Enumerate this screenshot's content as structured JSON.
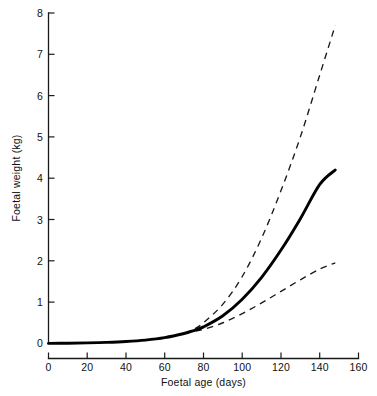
{
  "chart_data": {
    "type": "line",
    "title": "",
    "xlabel": "Foetal age (days)",
    "ylabel": "Foetal weight (kg)",
    "xlim": [
      0,
      160
    ],
    "ylim": [
      0,
      8
    ],
    "xticks": [
      0,
      20,
      40,
      60,
      80,
      100,
      120,
      140,
      160
    ],
    "xticklabels": [
      "0",
      "20",
      "40",
      "60",
      "80",
      "100",
      "120",
      "140",
      "160"
    ],
    "yticks": [
      0,
      1,
      2,
      3,
      4,
      5,
      6,
      7,
      8
    ],
    "yticklabels": [
      "0",
      "1",
      "2",
      "3",
      "4",
      "5",
      "6",
      "7",
      "8"
    ],
    "grid": false,
    "legend": "none",
    "series": [
      {
        "name": "mean-foetal-weight",
        "style": "solid",
        "linewidth": "thick",
        "color": "#000000",
        "x": [
          0,
          10,
          20,
          30,
          40,
          50,
          60,
          70,
          75,
          80,
          90,
          100,
          110,
          120,
          130,
          140,
          148
        ],
        "y": [
          0.0,
          0.005,
          0.012,
          0.024,
          0.045,
          0.08,
          0.14,
          0.24,
          0.31,
          0.4,
          0.67,
          1.07,
          1.6,
          2.26,
          3.02,
          3.85,
          4.2
        ]
      },
      {
        "name": "upper-bound",
        "style": "dashed",
        "linewidth": "thin",
        "color": "#1a1a1a",
        "x": [
          70,
          75,
          80,
          90,
          100,
          110,
          120,
          130,
          140,
          148
        ],
        "y": [
          0.24,
          0.34,
          0.5,
          0.95,
          1.62,
          2.55,
          3.7,
          5.0,
          6.5,
          7.7
        ]
      },
      {
        "name": "lower-bound",
        "style": "dashed",
        "linewidth": "thin",
        "color": "#1a1a1a",
        "x": [
          70,
          75,
          80,
          90,
          100,
          110,
          120,
          130,
          140,
          148
        ],
        "y": [
          0.24,
          0.29,
          0.34,
          0.5,
          0.72,
          0.98,
          1.26,
          1.54,
          1.8,
          1.95
        ]
      }
    ]
  },
  "axes": {
    "x_axis_name": "x-axis",
    "y_axis_name": "y-axis"
  }
}
